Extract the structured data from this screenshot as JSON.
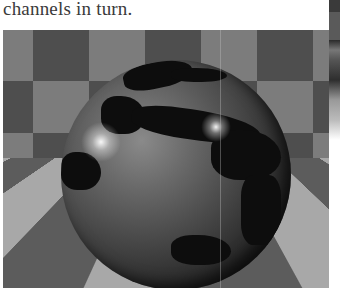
{
  "page": {
    "caption_text": "channels in turn."
  },
  "figure": {
    "colors": {
      "wall_dark": "#4e4e4e",
      "wall_light": "#7c7c7c",
      "floor_dark": "#5c5c5c",
      "floor_light": "#a8a8a8",
      "globe_land": "#0d0d0d",
      "globe_ocean": "#5a5a5a"
    }
  }
}
